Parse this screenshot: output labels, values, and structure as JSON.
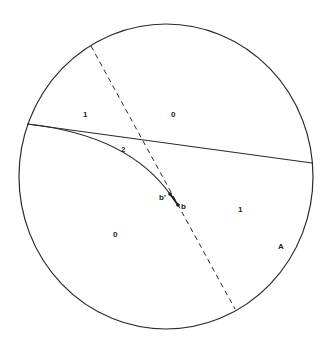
{
  "diagram": {
    "circle": {
      "cx": 166,
      "cy": 176.5,
      "rx": 147,
      "ry": 152.5,
      "stroke": "#2a2a2a"
    },
    "solid_line": {
      "x1": 27,
      "y1": 124,
      "x2": 312,
      "y2": 163
    },
    "dashed_line": {
      "x1": 91,
      "y1": 46,
      "x2": 235,
      "y2": 309
    },
    "curve": {
      "d": "M 27 124 Q 130 135 172 197"
    },
    "points": {
      "b_prime": {
        "x": 170,
        "y": 194
      },
      "b": {
        "x": 178,
        "y": 205
      }
    },
    "labels": {
      "region_upper_left": "1",
      "region_upper_right": "0",
      "region_lens": "2",
      "region_lower_left": "0",
      "region_lower_right": "1",
      "point_b_prime": "b'",
      "point_b": "b",
      "corner_label": "A"
    }
  }
}
